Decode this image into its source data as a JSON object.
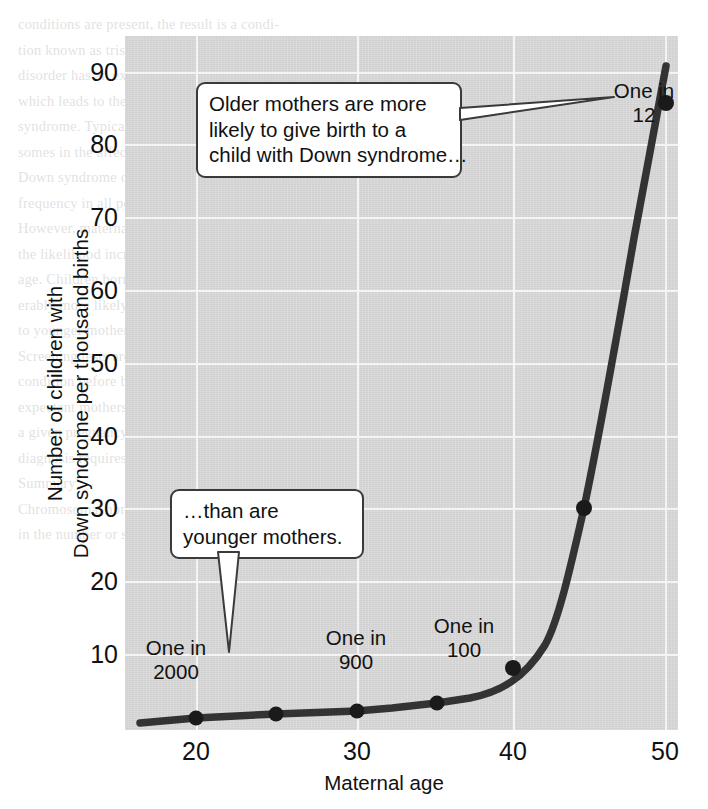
{
  "chart_data": {
    "type": "line",
    "title": "",
    "xlabel": "Maternal age",
    "ylabel": "Number of children with Down syndrome per thousand births",
    "ylabel_lines": [
      "Number of children with",
      "Down syndrome per thousand births"
    ],
    "xlim": [
      16,
      51
    ],
    "ylim": [
      0,
      94
    ],
    "xticks": [
      20,
      30,
      40,
      50
    ],
    "yticks": [
      10,
      20,
      30,
      40,
      50,
      60,
      70,
      80,
      90
    ],
    "grid": true,
    "legend": "none",
    "x": [
      20,
      25,
      30,
      35,
      40,
      45,
      50
    ],
    "values": [
      0.8,
      1.1,
      1.5,
      2.6,
      4.8,
      31.0,
      87.0
    ],
    "point_labels": [
      {
        "x": 20,
        "y": 0.8,
        "lines": [
          "One in",
          "2000"
        ]
      },
      {
        "x": 30,
        "y": 1.5,
        "lines": [
          "One in",
          "900"
        ]
      },
      {
        "x": 40,
        "y": 4.8,
        "lines": [
          "One in",
          "100"
        ]
      },
      {
        "x": 50,
        "y": 87.0,
        "lines": [
          "One in",
          "12"
        ]
      }
    ],
    "annotations": [
      {
        "id": "callout-top",
        "lines": [
          "Older mothers are more",
          "likely to give birth to a",
          "child with Down syndrome…"
        ],
        "points_to": "One in 12"
      },
      {
        "id": "callout-bottom",
        "lines": [
          "…than are",
          "younger mothers."
        ],
        "points_to": "One in 2000"
      }
    ],
    "colors": {
      "plot_background": "#d9d9d9",
      "gridline": "#f4f4f4",
      "line": "#333333",
      "marker": "#1a1a1a",
      "text": "#111111",
      "callout_border": "#3a3a3a",
      "callout_fill": "#ffffff"
    }
  },
  "axes": {
    "y_title_line1": "Number of children with",
    "y_title_line2": "Down syndrome per thousand births",
    "x_title": "Maternal age",
    "y_tick_labels": [
      "90",
      "80",
      "70",
      "60",
      "50",
      "40",
      "30",
      "20",
      "10"
    ],
    "x_tick_labels": [
      "20",
      "30",
      "40",
      "50"
    ]
  },
  "callouts": {
    "top": {
      "line1": "Older mothers are more",
      "line2": "likely to give birth to a",
      "line3": "child with Down syndrome…"
    },
    "bottom": {
      "line1": "…than are",
      "line2": "younger mothers."
    }
  },
  "point_labels": {
    "p2000": {
      "line1": "One in",
      "line2": "2000"
    },
    "p900": {
      "line1": "One in",
      "line2": "900"
    },
    "p100": {
      "line1": "One in",
      "line2": "100"
    },
    "p12": {
      "line1": "One in",
      "line2": "12"
    }
  },
  "page_bleed": {
    "lines": [
      "conditions are present, the result is a condi-",
      "tion known as trisomy 21. A child with this",
      "disorder has an extra copy of chromosome 21,",
      "which leads to the characteristic traits of the",
      "syndrome. Typically there are about 47 chromo-",
      "somes in the affected cells.",
      "Down syndrome occurs with roughly the same",
      "frequency in all populations and in every country.",
      "However, maternal age is a strong risk factor, and",
      "the likelihood increases markedly with advancing",
      "age. Children born to mothers over 40 are consid-",
      "erably more likely to be affected than those born",
      "to younger mothers.",
      "Screening tests are available to detect the",
      "condition before birth. Such tests are offered to",
      "expectant mothers and can estimate the risk that",
      "a given pregnancy is affected, although a definitive",
      "diagnosis requires further testing.",
      "",
      "Summary",
      "Chromosomal abnormalities arise when there is a defect",
      "in the number or structure of chromosomes. The most"
    ]
  }
}
